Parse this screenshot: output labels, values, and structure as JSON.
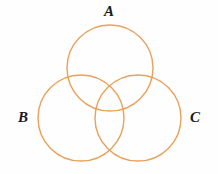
{
  "figure": {
    "type": "venn-diagram",
    "background_color": "#fefefe",
    "stroke_color": "#e8a25c",
    "stroke_width": 1.4,
    "width": 218,
    "height": 174
  },
  "chart_data": {
    "type": "diagram",
    "subtype": "venn",
    "title": "",
    "xlabel": "",
    "ylabel": "",
    "grid": false,
    "legend": "none",
    "set_count": 3,
    "fill": "none",
    "stroke": "#e8a25c",
    "sets": [
      {
        "name": "A",
        "label": "A",
        "label_position": "top",
        "cx": 110,
        "cy": 68,
        "r": 43
      },
      {
        "name": "B",
        "label": "B",
        "label_position": "left",
        "cx": 81,
        "cy": 118,
        "r": 43
      },
      {
        "name": "C",
        "label": "C",
        "label_position": "right",
        "cx": 138,
        "cy": 118,
        "r": 43
      }
    ],
    "regions": [
      "A",
      "B",
      "C",
      "A∩B",
      "A∩C",
      "B∩C",
      "A∩B∩C"
    ],
    "region_labels": []
  },
  "labels": {
    "a": "A",
    "b": "B",
    "c": "C"
  }
}
